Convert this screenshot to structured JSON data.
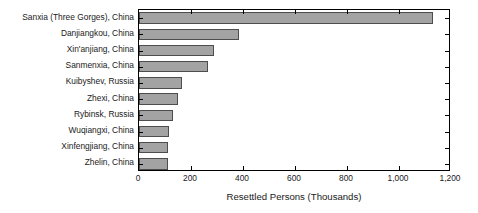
{
  "chart_data": {
    "type": "bar",
    "orientation": "horizontal",
    "title": "",
    "xlabel": "Resettled Persons (Thousands)",
    "ylabel": "",
    "xlim": [
      0,
      1200
    ],
    "xticks": [
      0,
      200,
      400,
      600,
      800,
      1000,
      1200
    ],
    "xticklabels": [
      "0",
      "200",
      "400",
      "600",
      "800",
      "1,000",
      "1,200"
    ],
    "grid": false,
    "legend": null,
    "bar_color": "#a3a3a3",
    "bar_edge_color": "#4d4d4d",
    "categories": [
      "Sanxia (Three Gorges), China",
      "Danjiangkou, China",
      "Xin'anjiang, China",
      "Sanmenxia, China",
      "Kuibyshev, Russia",
      "Zhexi, China",
      "Rybinsk, Russia",
      "Wuqiangxi, China",
      "Xinfengjiang, China",
      "Zhelin, China"
    ],
    "values": [
      1130,
      383,
      290,
      267,
      166,
      150,
      130,
      115,
      113,
      110
    ]
  },
  "axis": {
    "x_title": "Resettled Persons (Thousands)"
  }
}
